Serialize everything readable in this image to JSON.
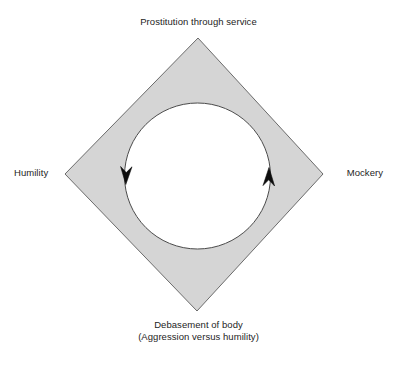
{
  "diagram": {
    "type": "cycle-diagram",
    "shape": "diamond-with-circular-cutout",
    "fill_color": "#d5d5d5",
    "stroke_color": "#5a5a5a",
    "background_color": "#ffffff",
    "text_color": "#242424",
    "labels": {
      "top": "Prostitution through service",
      "left": "Humility",
      "right": "Mockery",
      "bottom_line1": "Debasement of body",
      "bottom_line2": "(Aggression versus humility)"
    },
    "arrows": [
      {
        "name": "left-arrow-down",
        "direction": "down",
        "position": "left-of-circle"
      },
      {
        "name": "right-arrow-up",
        "direction": "up",
        "position": "right-of-circle"
      }
    ]
  }
}
